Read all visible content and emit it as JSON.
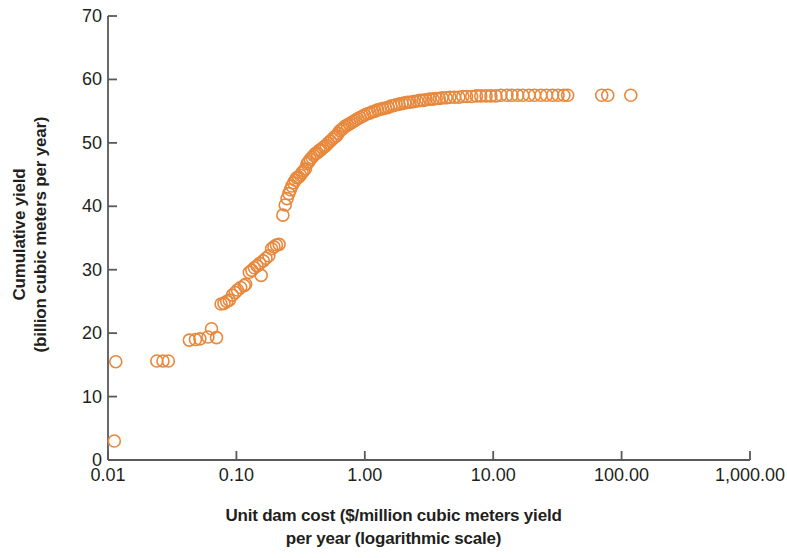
{
  "chart_data": {
    "type": "scatter",
    "title": "",
    "subtitle": "",
    "xlabel": "Unit dam cost ($/million cubic meters yield per year (logarithmic scale)",
    "xlabel_lines": [
      "Unit dam cost ($/million cubic meters yield",
      "per year (logarithmic scale)"
    ],
    "ylabel": "Cumulative yield (billion cubic meters per year)",
    "ylabel_lines": [
      "Cumulative yield",
      "(billion cubic meters per year)"
    ],
    "xscale": "log",
    "yscale": "linear",
    "xlim": [
      0.01,
      1000
    ],
    "ylim": [
      0,
      70
    ],
    "xticks": [
      0.01,
      0.1,
      1,
      10,
      100,
      1000
    ],
    "xtick_labels": [
      "0.01",
      "0.10",
      "1.00",
      "10.00",
      "100.00",
      "1,000.00"
    ],
    "yticks": [
      0,
      10,
      20,
      30,
      40,
      50,
      60,
      70
    ],
    "ytick_labels": [
      "0",
      "10",
      "20",
      "30",
      "40",
      "50",
      "60",
      "70"
    ],
    "grid": false,
    "legend": null,
    "marker": {
      "shape": "circle-open",
      "edge_color": "#E8883C",
      "fill_color": "none",
      "size_px": 12,
      "stroke_width": 1.6
    },
    "axis_color": "#58595b",
    "series": [
      {
        "name": "Dams (cumulative yield vs unit cost)",
        "points": [
          [
            0.0112,
            3.0
          ],
          [
            0.0115,
            15.5
          ],
          [
            0.024,
            15.6
          ],
          [
            0.0268,
            15.6
          ],
          [
            0.0295,
            15.6
          ],
          [
            0.043,
            18.9
          ],
          [
            0.048,
            19.0
          ],
          [
            0.052,
            19.1
          ],
          [
            0.06,
            19.4
          ],
          [
            0.064,
            20.7
          ],
          [
            0.07,
            19.3
          ],
          [
            0.076,
            24.6
          ],
          [
            0.08,
            24.7
          ],
          [
            0.084,
            25.0
          ],
          [
            0.088,
            25.2
          ],
          [
            0.093,
            26.0
          ],
          [
            0.098,
            26.4
          ],
          [
            0.102,
            26.8
          ],
          [
            0.108,
            27.2
          ],
          [
            0.115,
            27.5
          ],
          [
            0.118,
            27.7
          ],
          [
            0.126,
            29.6
          ],
          [
            0.132,
            29.9
          ],
          [
            0.138,
            30.3
          ],
          [
            0.145,
            30.6
          ],
          [
            0.152,
            31.0
          ],
          [
            0.156,
            29.1
          ],
          [
            0.162,
            31.4
          ],
          [
            0.17,
            31.8
          ],
          [
            0.179,
            32.2
          ],
          [
            0.188,
            33.3
          ],
          [
            0.196,
            33.6
          ],
          [
            0.205,
            33.9
          ],
          [
            0.215,
            34.0
          ],
          [
            0.23,
            38.6
          ],
          [
            0.24,
            40.2
          ],
          [
            0.248,
            41.2
          ],
          [
            0.256,
            42.0
          ],
          [
            0.263,
            42.6
          ],
          [
            0.27,
            43.2
          ],
          [
            0.279,
            43.7
          ],
          [
            0.287,
            44.1
          ],
          [
            0.295,
            44.5
          ],
          [
            0.305,
            44.6
          ],
          [
            0.315,
            44.9
          ],
          [
            0.325,
            45.3
          ],
          [
            0.335,
            45.6
          ],
          [
            0.345,
            45.9
          ],
          [
            0.355,
            46.7
          ],
          [
            0.365,
            47.0
          ],
          [
            0.376,
            47.4
          ],
          [
            0.388,
            47.7
          ],
          [
            0.4,
            48.0
          ],
          [
            0.412,
            48.3
          ],
          [
            0.425,
            48.4
          ],
          [
            0.44,
            48.8
          ],
          [
            0.455,
            48.9
          ],
          [
            0.47,
            49.2
          ],
          [
            0.485,
            49.4
          ],
          [
            0.5,
            49.6
          ],
          [
            0.52,
            50.0
          ],
          [
            0.54,
            50.3
          ],
          [
            0.56,
            50.6
          ],
          [
            0.58,
            50.9
          ],
          [
            0.6,
            51.1
          ],
          [
            0.62,
            51.5
          ],
          [
            0.64,
            51.9
          ],
          [
            0.66,
            52.1
          ],
          [
            0.68,
            52.3
          ],
          [
            0.7,
            52.6
          ],
          [
            0.73,
            52.8
          ],
          [
            0.76,
            53.0
          ],
          [
            0.79,
            53.2
          ],
          [
            0.82,
            53.4
          ],
          [
            0.85,
            53.6
          ],
          [
            0.88,
            53.8
          ],
          [
            0.92,
            54.0
          ],
          [
            0.96,
            54.2
          ],
          [
            1.0,
            54.4
          ],
          [
            1.05,
            54.6
          ],
          [
            1.1,
            54.7
          ],
          [
            1.15,
            54.9
          ],
          [
            1.2,
            55.0
          ],
          [
            1.26,
            55.2
          ],
          [
            1.32,
            55.3
          ],
          [
            1.38,
            55.4
          ],
          [
            1.45,
            55.5
          ],
          [
            1.52,
            55.6
          ],
          [
            1.6,
            55.8
          ],
          [
            1.68,
            55.9
          ],
          [
            1.76,
            56.0
          ],
          [
            1.85,
            56.1
          ],
          [
            1.95,
            56.2
          ],
          [
            2.05,
            56.3
          ],
          [
            2.15,
            56.4
          ],
          [
            2.25,
            56.4
          ],
          [
            2.4,
            56.5
          ],
          [
            2.55,
            56.6
          ],
          [
            2.7,
            56.7
          ],
          [
            2.85,
            56.7
          ],
          [
            3.0,
            56.8
          ],
          [
            3.2,
            56.9
          ],
          [
            3.4,
            56.9
          ],
          [
            3.6,
            57.0
          ],
          [
            3.8,
            57.0
          ],
          [
            4.0,
            57.1
          ],
          [
            4.3,
            57.1
          ],
          [
            4.6,
            57.2
          ],
          [
            5.0,
            57.2
          ],
          [
            5.4,
            57.2
          ],
          [
            5.8,
            57.3
          ],
          [
            6.2,
            57.3
          ],
          [
            6.8,
            57.3
          ],
          [
            7.4,
            57.4
          ],
          [
            8.0,
            57.4
          ],
          [
            8.8,
            57.4
          ],
          [
            9.6,
            57.4
          ],
          [
            10.5,
            57.4
          ],
          [
            11.5,
            57.5
          ],
          [
            12.8,
            57.5
          ],
          [
            14.0,
            57.5
          ],
          [
            15.5,
            57.5
          ],
          [
            17.0,
            57.5
          ],
          [
            19.0,
            57.5
          ],
          [
            21.0,
            57.5
          ],
          [
            23.5,
            57.5
          ],
          [
            26.0,
            57.5
          ],
          [
            29.0,
            57.5
          ],
          [
            32.0,
            57.5
          ],
          [
            35.5,
            57.5
          ],
          [
            38.0,
            57.5
          ],
          [
            70.0,
            57.5
          ],
          [
            78.0,
            57.5
          ],
          [
            118.0,
            57.5
          ]
        ]
      }
    ]
  }
}
